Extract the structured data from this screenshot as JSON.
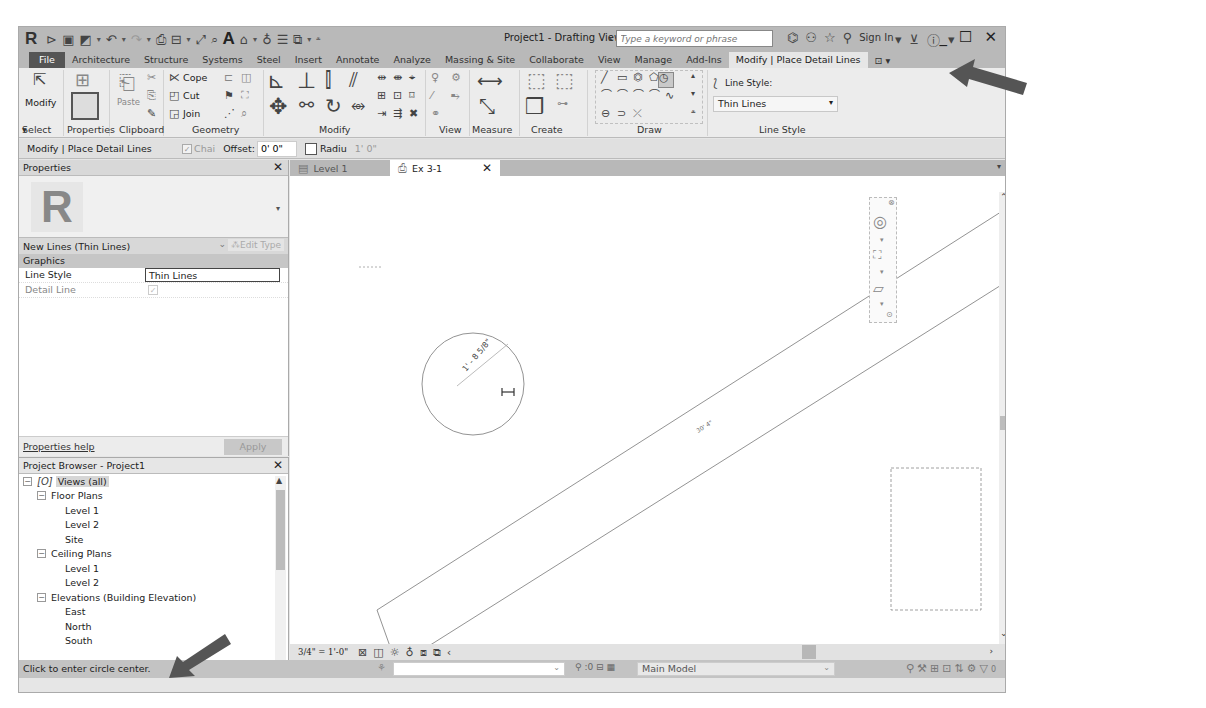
{
  "titlebar": {
    "title": "Project1 - Drafting View: Ex 3-1",
    "search_placeholder": "Type a keyword or phrase",
    "sign_in": "Sign In",
    "quick_access": [
      "open-icon",
      "save-icon",
      "sync-icon",
      "undo-icon",
      "redo-icon",
      "print-icon",
      "measure-icon",
      "aligned-dimension-icon",
      "tag-icon",
      "text-icon",
      "3d-view-icon",
      "section-icon",
      "thin-lines-icon",
      "switch-windows-icon",
      "customize-icon"
    ],
    "window_controls": [
      "minimize",
      "maximize",
      "close"
    ]
  },
  "ribbon": {
    "tabs": [
      {
        "label": "File"
      },
      {
        "label": "Architecture"
      },
      {
        "label": "Structure"
      },
      {
        "label": "Systems"
      },
      {
        "label": "Steel"
      },
      {
        "label": "Insert"
      },
      {
        "label": "Annotate"
      },
      {
        "label": "Analyze"
      },
      {
        "label": "Massing & Site"
      },
      {
        "label": "Collaborate"
      },
      {
        "label": "View"
      },
      {
        "label": "Manage"
      },
      {
        "label": "Add-Ins"
      },
      {
        "label": "Modify | Place Detail Lines",
        "active": true
      }
    ],
    "modify_label": "Modify",
    "paste_label": "Paste",
    "cope_label": "Cope",
    "cut_label": "Cut",
    "join_label": "Join",
    "line_style_label": "Line Style:",
    "line_style_value": "Thin Lines",
    "panels": [
      "Select",
      "Properties",
      "Clipboard",
      "Geometry",
      "Modify",
      "View",
      "Measure",
      "Create",
      "Draw",
      "Line Style"
    ]
  },
  "options_bar": {
    "context": "Modify | Place Detail Lines",
    "chain_label": "Chai",
    "offset_label": "Offset:",
    "offset_value": "0' 0\"",
    "radius_label": "Radiu",
    "radius_value": "1'  0\""
  },
  "properties": {
    "title": "Properties",
    "type_name": "New Lines (Thin Lines)",
    "edit_type": "Edit Type",
    "group": "Graphics",
    "rows": [
      {
        "key": "Line Style",
        "value": "Thin Lines"
      },
      {
        "key": "Detail Line",
        "value": "checked"
      }
    ],
    "help_link": "Properties help",
    "apply": "Apply"
  },
  "project_browser": {
    "title": "Project Browser - Project1",
    "items": [
      {
        "label": "Views (all)",
        "level": 0,
        "toggle": "−"
      },
      {
        "label": "Floor Plans",
        "level": 1,
        "toggle": "−"
      },
      {
        "label": "Level 1",
        "level": 2
      },
      {
        "label": "Level 2",
        "level": 2
      },
      {
        "label": "Site",
        "level": 2
      },
      {
        "label": "Ceiling Plans",
        "level": 1,
        "toggle": "−"
      },
      {
        "label": "Level 1",
        "level": 2
      },
      {
        "label": "Level 2",
        "level": 2
      },
      {
        "label": "Elevations (Building Elevation)",
        "level": 1,
        "toggle": "−"
      },
      {
        "label": "East",
        "level": 2
      },
      {
        "label": "North",
        "level": 2
      },
      {
        "label": "South",
        "level": 2
      }
    ]
  },
  "view_tabs": [
    {
      "label": "Level 1",
      "active": false
    },
    {
      "label": "Ex 3-1",
      "active": true
    }
  ],
  "canvas": {
    "circle_dimension": "1' - 8 5/8\"",
    "line_dimension": "30' 4\""
  },
  "view_control": {
    "scale": "3/4\" = 1'-0\""
  },
  "status": {
    "message": "Click to enter circle center.",
    "zero_count": ":0",
    "design_model": "Main Model",
    "filter_count": "0"
  },
  "colors": {
    "titlebar_bg": "#b9b9b9",
    "ribbon_bg": "#ececec",
    "status_bg": "#c3c3c3",
    "arrow": "#555555"
  }
}
